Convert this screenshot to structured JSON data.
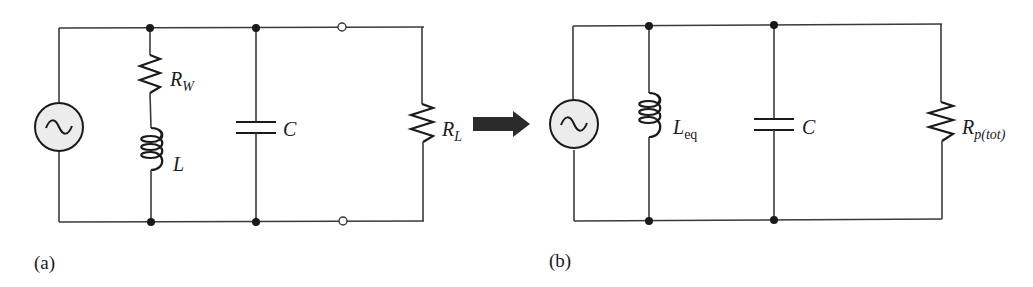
{
  "figure": {
    "panels": [
      {
        "id": "a",
        "caption": "(a)",
        "components": [
          {
            "type": "ac-source",
            "label": ""
          },
          {
            "type": "resistor",
            "label_main": "R",
            "label_sub": "W"
          },
          {
            "type": "inductor",
            "label_main": "L",
            "label_sub": ""
          },
          {
            "type": "capacitor",
            "label_main": "C",
            "label_sub": ""
          },
          {
            "type": "resistor",
            "label_main": "R",
            "label_sub": "L"
          }
        ],
        "open_terminals": 2
      },
      {
        "id": "b",
        "caption": "(b)",
        "components": [
          {
            "type": "ac-source",
            "label": ""
          },
          {
            "type": "inductor",
            "label_main": "L",
            "label_sub": "eq"
          },
          {
            "type": "capacitor",
            "label_main": "C",
            "label_sub": ""
          },
          {
            "type": "resistor",
            "label_main": "R",
            "label_sub": "p(tot)"
          }
        ]
      }
    ],
    "arrow": {
      "direction": "right",
      "color": "#2b2b2b"
    }
  }
}
